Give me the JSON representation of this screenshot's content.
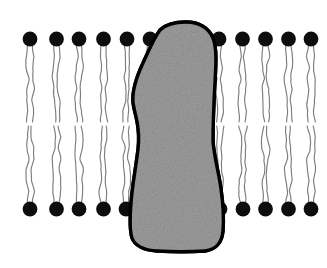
{
  "figure": {
    "background_color": "#ffffff",
    "width": 327,
    "height": 268
  },
  "membrane": {
    "name": "phospholipid-bilayer",
    "head_color": "#0d0d0d",
    "tail_color": "#7d7d7d",
    "head_radius": 7.4,
    "tail_length": 76,
    "tail_pair_offset": 2.6,
    "outer_leaflet": {
      "label": "outer-leaflet",
      "head_center_y": 39,
      "direction": "down",
      "head_x": [
        30,
        56.5,
        79,
        103.5,
        127,
        150,
        219,
        242.5,
        265.5,
        288.5,
        311
      ]
    },
    "inner_leaflet": {
      "label": "inner-leaflet",
      "head_center_y": 209,
      "direction": "up",
      "head_x": [
        30,
        56.5,
        79,
        103.5,
        126,
        220,
        243,
        265.5,
        288.5,
        311
      ]
    },
    "midline_gap": {
      "label": "bilayer-midline-gap",
      "top_y": 117,
      "bottom_y": 130
    }
  },
  "protein": {
    "name": "transmembrane-protein",
    "fill_color": "#9e9e9e",
    "outline_color": "#000000",
    "outline_width": 3.4,
    "texture": "speckled-gray-stipple",
    "bounds": {
      "x_min": 126,
      "x_max": 224,
      "y_min": 22,
      "y_max": 252
    },
    "outline_path": "M 186 22 C 199 22 209 28 213 38 C 217 48 216 64 215 82 C 214 100 213 122 213 141 C 214 157 219 173 221 189 C 223 203 224 218 223 231 C 222 242 216 250 205 251 C 191 252 173 252 157 251 C 143 250 135 246 132 238 C 129 229 130 216 131 203 C 132 188 135 172 137 157 C 139 145 139 136 138 128 C 137 118 134 111 133 102 C 132 90 136 78 143 63 C 149 50 154 38 160 30 C 166 24 175 22 186 22 Z"
  },
  "elements": {
    "head_name": "phospholipid-head",
    "tail_name": "phospholipid-tail",
    "protein_name": "membrane-protein-shape"
  }
}
